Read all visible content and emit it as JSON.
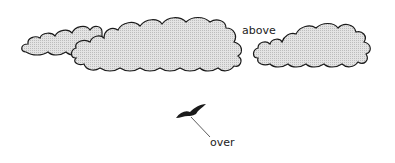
{
  "diagram": {
    "labels": {
      "above": "above",
      "over": "over"
    },
    "colors": {
      "cloud_fill": "#d9d9d9",
      "outline": "#1a1a1a",
      "background": "#ffffff"
    },
    "elements": [
      "clouds",
      "bird",
      "pointer-line"
    ]
  }
}
